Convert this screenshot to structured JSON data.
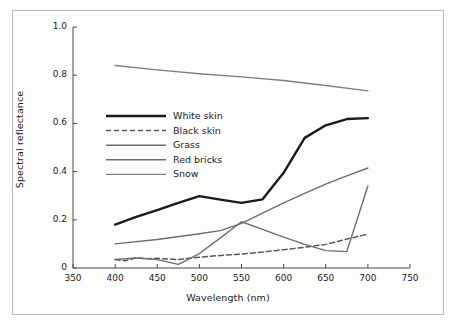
{
  "figure": {
    "background_color": "#fdfdfc",
    "frame_color": "#b9b9b9"
  },
  "chart_data": {
    "type": "line",
    "title": "",
    "xlabel": "Wavelength (nm)",
    "ylabel": "Spectral reflectance",
    "xlim": [
      350,
      750
    ],
    "ylim": [
      0,
      1.0
    ],
    "xticks": [
      "350",
      "400",
      "450",
      "500",
      "550",
      "600",
      "650",
      "700",
      "750"
    ],
    "xtick_values": [
      350,
      400,
      450,
      500,
      550,
      600,
      650,
      700,
      750
    ],
    "yticks": [
      "0",
      "0.2",
      "0.4",
      "0.6",
      "0.8",
      "1.0"
    ],
    "ytick_values": [
      0,
      0.2,
      0.4,
      0.6,
      0.8,
      1.0
    ],
    "grid": false,
    "legend_position": "upper left inside",
    "series": [
      {
        "name": "White skin",
        "color": "#1a1a1a",
        "width": 2.4,
        "dash": "solid",
        "x": [
          400,
          425,
          450,
          475,
          500,
          525,
          550,
          575,
          600,
          625,
          650,
          675,
          700
        ],
        "y": [
          0.18,
          0.212,
          0.24,
          0.27,
          0.298,
          0.284,
          0.27,
          0.285,
          0.395,
          0.54,
          0.592,
          0.618,
          0.622
        ]
      },
      {
        "name": "Black skin",
        "color": "#595959",
        "width": 1.5,
        "dash": "dashed",
        "x": [
          400,
          412,
          425,
          437,
          450,
          475,
          500,
          525,
          550,
          575,
          600,
          625,
          650,
          675,
          700
        ],
        "y": [
          0.035,
          0.03,
          0.042,
          0.038,
          0.04,
          0.035,
          0.045,
          0.052,
          0.058,
          0.066,
          0.076,
          0.086,
          0.098,
          0.12,
          0.14
        ]
      },
      {
        "name": "Grass",
        "color": "#6e6e6e",
        "width": 1.4,
        "dash": "solid",
        "x": [
          400,
          425,
          450,
          475,
          500,
          525,
          550,
          575,
          600,
          625,
          650,
          675,
          700
        ],
        "y": [
          0.035,
          0.042,
          0.035,
          0.015,
          0.06,
          0.125,
          0.192,
          0.16,
          0.128,
          0.098,
          0.072,
          0.068,
          0.34
        ]
      },
      {
        "name": "Red bricks",
        "color": "#6e6e6e",
        "width": 1.4,
        "dash": "solid",
        "x": [
          400,
          450,
          500,
          525,
          550,
          575,
          600,
          625,
          650,
          675,
          700
        ],
        "y": [
          0.1,
          0.118,
          0.142,
          0.155,
          0.185,
          0.228,
          0.27,
          0.31,
          0.348,
          0.382,
          0.415
        ]
      },
      {
        "name": "Snow",
        "color": "#808080",
        "width": 1.4,
        "dash": "solid",
        "x": [
          400,
          450,
          500,
          550,
          600,
          650,
          700
        ],
        "y": [
          0.84,
          0.822,
          0.806,
          0.793,
          0.778,
          0.757,
          0.735
        ]
      }
    ]
  },
  "legend": {
    "items": [
      {
        "label": "White skin"
      },
      {
        "label": "Black skin"
      },
      {
        "label": "Grass"
      },
      {
        "label": "Red bricks"
      },
      {
        "label": "Snow"
      }
    ]
  }
}
